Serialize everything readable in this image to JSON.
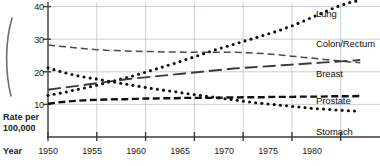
{
  "chart_data": {
    "type": "line",
    "title": "",
    "subtitle": "",
    "xlabel": "Year",
    "ylabel": "Rate per 100,000",
    "ylabel_line1": "Rate per",
    "ylabel_line2": "100,000",
    "xlim": [
      1950,
      1983
    ],
    "ylim": [
      0,
      42
    ],
    "grid": true,
    "legend_position": "right-inline",
    "x_ticks": [
      1950,
      1955,
      1960,
      1965,
      1970,
      1975,
      1980
    ],
    "y_ticks": [
      10,
      20,
      30,
      40
    ],
    "x": [
      1950,
      1951,
      1952,
      1953,
      1954,
      1955,
      1956,
      1957,
      1958,
      1959,
      1960,
      1961,
      1962,
      1963,
      1964,
      1965,
      1966,
      1967,
      1968,
      1969,
      1970,
      1971,
      1972,
      1973,
      1974,
      1975,
      1976,
      1977,
      1978,
      1979,
      1980,
      1981,
      1982
    ],
    "series": [
      {
        "name": "Lung",
        "style": "dotted",
        "color": "#111111",
        "label_x": 1980.6,
        "label_y": 39.5,
        "values": [
          12.8,
          13.3,
          13.9,
          14.6,
          15.2,
          15.9,
          16.7,
          17.4,
          18.2,
          19.0,
          19.9,
          20.8,
          21.7,
          22.6,
          23.6,
          24.6,
          25.6,
          26.6,
          27.5,
          28.4,
          29.3,
          30.2,
          31.1,
          32.0,
          33.0,
          34.1,
          35.3,
          36.6,
          37.9,
          39.2,
          40.4,
          41.3,
          41.9
        ]
      },
      {
        "name": "Colon/Rectum",
        "style": "dashed-medium",
        "color": "#4a4a4a",
        "label_x": 1980.6,
        "label_y": 26.4,
        "values": [
          28.2,
          27.9,
          27.6,
          27.3,
          27.0,
          26.8,
          26.6,
          26.5,
          26.4,
          26.3,
          26.2,
          26.2,
          26.1,
          26.1,
          26.0,
          26.0,
          26.0,
          26.0,
          26.0,
          26.0,
          25.9,
          25.8,
          25.6,
          25.4,
          25.1,
          24.8,
          24.5,
          24.2,
          23.9,
          23.6,
          23.3,
          23.0,
          22.8
        ]
      },
      {
        "name": "Breast",
        "style": "dashed-long",
        "color": "#3a3a3a",
        "label_x": 1980.6,
        "label_y": 20.5,
        "values": [
          14.5,
          14.9,
          15.3,
          15.7,
          16.1,
          16.5,
          16.9,
          17.3,
          17.7,
          18.0,
          18.3,
          18.6,
          18.9,
          19.2,
          19.5,
          19.8,
          20.1,
          20.4,
          20.7,
          21.0,
          21.2,
          21.4,
          21.6,
          21.8,
          22.0,
          22.2,
          22.4,
          22.6,
          22.8,
          23.0,
          23.2,
          23.4,
          23.6
        ]
      },
      {
        "name": "Prostate",
        "style": "dashed-heavy",
        "color": "#111111",
        "label_x": 1980.6,
        "label_y": 14.5,
        "values": [
          10.2,
          10.6,
          10.9,
          11.1,
          11.3,
          11.4,
          11.5,
          11.6,
          11.6,
          11.7,
          11.8,
          11.8,
          11.9,
          11.9,
          12.0,
          12.0,
          12.0,
          12.0,
          12.1,
          12.1,
          12.2,
          12.2,
          12.2,
          12.3,
          12.3,
          12.3,
          12.4,
          12.4,
          12.4,
          12.5,
          12.5,
          12.5,
          12.6
        ]
      },
      {
        "name": "Stomach",
        "style": "dotted",
        "color": "#111111",
        "label_x": 1980.6,
        "label_y": 6.0,
        "values": [
          21.2,
          20.3,
          19.5,
          18.8,
          18.2,
          17.8,
          17.2,
          16.7,
          16.2,
          15.7,
          15.2,
          14.7,
          14.3,
          13.9,
          13.4,
          13.0,
          12.6,
          12.2,
          11.8,
          11.4,
          11.0,
          10.6,
          10.3,
          10.0,
          9.7,
          9.4,
          9.1,
          8.8,
          8.6,
          8.4,
          8.2,
          8.0,
          7.9
        ]
      }
    ]
  },
  "axis": {
    "x_title": "Year",
    "y_title_line1": "Rate per",
    "y_title_line2": "100,000"
  },
  "colors": {
    "axis": "#3d3d3d",
    "grid": "#b8b8c4",
    "text": "#111111",
    "background": "#ffffff"
  }
}
